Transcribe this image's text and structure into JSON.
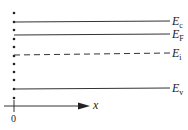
{
  "diagram": {
    "type": "energy-band-diagram",
    "levels": [
      {
        "name": "conduction-band",
        "symbol": "E",
        "sub": "c",
        "y": 22,
        "style": "solid"
      },
      {
        "name": "fermi-level",
        "symbol": "E",
        "sub": "F",
        "y": 35,
        "style": "solid"
      },
      {
        "name": "intrinsic-level",
        "symbol": "E",
        "sub": "i",
        "y": 55,
        "style": "dashed"
      },
      {
        "name": "valence-band",
        "symbol": "E",
        "sub": "v",
        "y": 89,
        "style": "solid"
      }
    ],
    "axis": {
      "label": "x",
      "origin_label": "0"
    },
    "surface_dots": [
      13,
      22,
      30,
      39,
      47,
      56,
      64,
      72,
      80,
      89,
      98
    ],
    "colors": {
      "line": "#333333",
      "text": "#222222",
      "background": "#ffffff"
    }
  }
}
